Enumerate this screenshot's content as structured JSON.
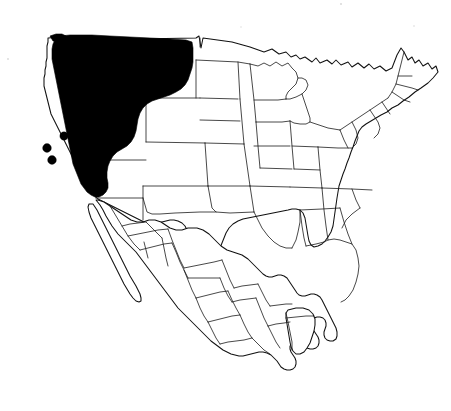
{
  "figure": {
    "kind": "distribution-map",
    "title": "",
    "caption": "",
    "region_name": "North America",
    "background_color": "#ffffff",
    "outline_color": "#1a1a1a",
    "range_fill_color": "#000000",
    "dot_color": "#000000",
    "width_px": 451,
    "height_px": 411
  },
  "legend": {
    "shaded_range_label": "",
    "point_record_label": "",
    "visible": false
  },
  "map_layers": {
    "country_outlines": [
      "United States",
      "Mexico",
      "Canada (southern border)"
    ],
    "subdivision_outlines_shown": true
  },
  "range_polygon": {
    "name": "shaded-distribution-range",
    "approx_states_covered": [
      "Washington",
      "Oregon",
      "Idaho",
      "western Montana",
      "Nevada",
      "northern California",
      "northwestern Utah"
    ],
    "fill": "#000000"
  },
  "occurrence_points": [
    {
      "id": "point-1",
      "x": 64,
      "y": 136,
      "r": 4.2,
      "label": ""
    },
    {
      "id": "point-2",
      "x": 47,
      "y": 148,
      "r": 4.4,
      "label": ""
    },
    {
      "id": "point-3",
      "x": 52,
      "y": 160,
      "r": 4.4,
      "label": ""
    }
  ],
  "annotations": {
    "labels": [],
    "scale_bar": "",
    "north_arrow": "",
    "axis_ticks": []
  }
}
